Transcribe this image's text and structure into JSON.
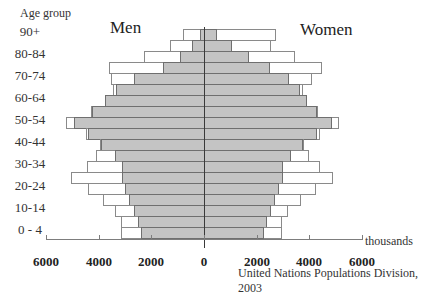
{
  "chart_data": {
    "type": "bar",
    "subtype": "population-pyramid",
    "title": "",
    "ylabel": "Age group",
    "xlabel": "thousands",
    "source": "United Nations Populations Division, 2003",
    "left_series_label": "Men",
    "right_series_label": "Women",
    "xlim": [
      -6000,
      6000
    ],
    "xticks": [
      -6000,
      -4000,
      -2000,
      0,
      2000,
      4000,
      6000
    ],
    "xtick_labels": [
      "6000",
      "4000",
      "2000",
      "0",
      "2000",
      "4000",
      "6000"
    ],
    "ytick_labels": [
      "90+",
      "80-84",
      "70-74",
      "60-64",
      "50-54",
      "40-44",
      "30-34",
      "20-24",
      "10-14",
      "0 - 4"
    ],
    "categories": [
      "90+",
      "85-89",
      "80-84",
      "75-79",
      "70-74",
      "65-69",
      "60-64",
      "55-59",
      "50-54",
      "45-49",
      "40-44",
      "35-39",
      "30-34",
      "25-29",
      "20-24",
      "15-19",
      "10-14",
      "5-9",
      "0-4"
    ],
    "series": [
      {
        "name": "Men (outline)",
        "side": "left",
        "style": "outline",
        "values": [
          800,
          1300,
          2300,
          3600,
          3550,
          3450,
          3750,
          4300,
          5250,
          4500,
          3950,
          4100,
          4450,
          5050,
          4400,
          3850,
          3400,
          3150,
          3150
        ]
      },
      {
        "name": "Men (shaded)",
        "side": "left",
        "style": "shaded",
        "values": [
          150,
          450,
          900,
          1550,
          2650,
          3350,
          3750,
          4250,
          4950,
          4400,
          3900,
          3400,
          3100,
          3100,
          3000,
          2850,
          2650,
          2500,
          2400
        ]
      },
      {
        "name": "Women (outline)",
        "side": "right",
        "style": "outline",
        "values": [
          2750,
          2550,
          3450,
          4500,
          4100,
          3750,
          3900,
          4350,
          5150,
          4400,
          3800,
          4000,
          4400,
          4900,
          4250,
          3700,
          3200,
          2950,
          2950
        ]
      },
      {
        "name": "Women (shaded)",
        "side": "right",
        "style": "shaded",
        "values": [
          500,
          1050,
          1700,
          2500,
          3250,
          3650,
          3900,
          4300,
          4850,
          4300,
          3750,
          3300,
          3000,
          3000,
          2850,
          2700,
          2550,
          2400,
          2300
        ]
      }
    ],
    "grid": false,
    "legend_position": "none"
  },
  "labels": {
    "age_title": "Age group",
    "men": "Men",
    "women": "Women",
    "units": "thousands",
    "source": "United Nations Populations Division, 2003"
  },
  "colors": {
    "shaded_fill": "#c4c4c4",
    "outline_fill": "#ffffff",
    "border": "#6f6f6f",
    "text": "#222222"
  }
}
